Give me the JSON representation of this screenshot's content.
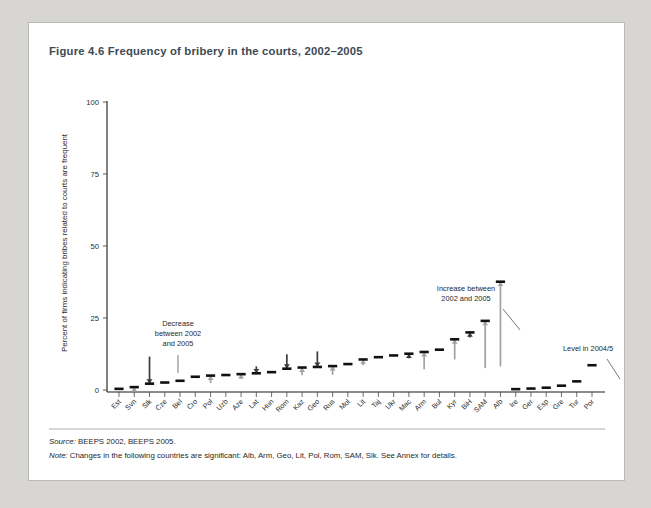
{
  "figure": {
    "title": "Figure 4.6  Frequency of bribery in the courts, 2002–2005",
    "source_label": "Source:",
    "source_text": "BEEPS 2002, BEEPS 2005.",
    "note_label": "Note:",
    "note_text": "Changes in the following countries are significant: Alb, Arm, Geo, Lit, Pol, Rom, SAM, Slk. See Annex for details."
  },
  "chart_data": {
    "type": "scatter",
    "title": "Frequency of bribery in the courts, 2002–2005",
    "xlabel": "",
    "ylabel": "Percent of firms indicating bribes related to courts are frequent",
    "ylim": [
      0,
      100
    ],
    "yticks": [
      0,
      25,
      50,
      75,
      100
    ],
    "grid": false,
    "legend": "none",
    "categories": [
      "Est",
      "Svn",
      "Slk",
      "Cze",
      "Bel",
      "Cro",
      "Pol",
      "Uzb",
      "Aze",
      "Lat",
      "Hun",
      "Rom",
      "Kaz",
      "Geo",
      "Rus",
      "Mol",
      "Lit",
      "Taj",
      "Ukr",
      "Mac",
      "Arm",
      "Bul",
      "Kyr",
      "BiH",
      "SAM",
      "Alb",
      "Ire",
      "Ger",
      "Esp",
      "Gre",
      "Tur",
      "Por"
    ],
    "series": [
      {
        "name": "Level in 2004/5",
        "values": [
          0.4,
          1.0,
          2.2,
          2.6,
          3.2,
          4.6,
          5.0,
          5.2,
          5.5,
          5.8,
          6.2,
          7.4,
          7.8,
          8.0,
          8.3,
          9.0,
          10.6,
          11.4,
          12.0,
          12.6,
          13.2,
          14.0,
          17.6,
          20.0,
          24.0,
          37.6,
          0.3,
          0.5,
          0.8,
          1.5,
          3.0,
          8.6
        ]
      },
      {
        "name": "Level in 2002",
        "values": [
          null,
          0.1,
          11.6,
          null,
          null,
          null,
          2.4,
          null,
          3.9,
          8.2,
          null,
          12.4,
          5.1,
          13.4,
          5.2,
          null,
          8.6,
          null,
          null,
          11.0,
          7.2,
          null,
          10.6,
          18.2,
          7.6,
          8.2,
          null,
          null,
          null,
          null,
          null,
          null
        ]
      }
    ],
    "changes": [
      {
        "category": "Svn",
        "direction": "increase"
      },
      {
        "category": "Slk",
        "direction": "decrease"
      },
      {
        "category": "Pol",
        "direction": "increase"
      },
      {
        "category": "Aze",
        "direction": "increase"
      },
      {
        "category": "Lat",
        "direction": "decrease"
      },
      {
        "category": "Rom",
        "direction": "decrease"
      },
      {
        "category": "Kaz",
        "direction": "increase"
      },
      {
        "category": "Geo",
        "direction": "decrease"
      },
      {
        "category": "Rus",
        "direction": "increase"
      },
      {
        "category": "Lit",
        "direction": "increase"
      },
      {
        "category": "Mac",
        "direction": "decrease"
      },
      {
        "category": "Arm",
        "direction": "increase"
      },
      {
        "category": "Kyr",
        "direction": "increase"
      },
      {
        "category": "BiH",
        "direction": "decrease"
      },
      {
        "category": "SAM",
        "direction": "increase"
      },
      {
        "category": "Alb",
        "direction": "increase"
      }
    ],
    "annotations": [
      {
        "id": "decrease",
        "lines": [
          "Decrease",
          "between 2002",
          "and 2005"
        ],
        "x": 149,
        "y": 303,
        "anchor": "middle",
        "leader": [
          149,
          332,
          149,
          350
        ]
      },
      {
        "id": "increase",
        "lines": [
          "Increase between",
          "2002 and 2005"
        ],
        "x": 437,
        "y": 268,
        "anchor": "middle",
        "leader": [
          474,
          286,
          491,
          307
        ]
      },
      {
        "id": "level",
        "lines": [
          "Level in 2004/5"
        ],
        "x": 534,
        "y": 328,
        "anchor": "start",
        "leader": [
          578,
          336,
          591,
          356
        ]
      }
    ],
    "colors": {
      "level": "#111111",
      "increase": "#a2a2a2",
      "decrease": "#3a3a3a",
      "axis": "#1a1a1a"
    }
  }
}
